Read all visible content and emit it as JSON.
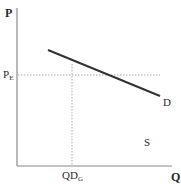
{
  "diagram": {
    "type": "supply-demand",
    "axes": {
      "y_label": "P",
      "x_label": "Q"
    },
    "price_label": {
      "main": "P",
      "sub": "E"
    },
    "quantity_label": {
      "main": "QD",
      "sub": "G"
    },
    "curves": [
      {
        "name": "D",
        "label": "D",
        "color": "#333333"
      }
    ],
    "region_label": "S",
    "colors": {
      "axis": "#888888",
      "curve": "#333333",
      "guide": "#999999"
    }
  }
}
